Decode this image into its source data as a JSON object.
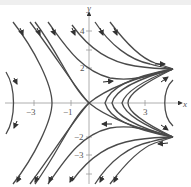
{
  "figure": {
    "type": "phase-portrait",
    "axes": {
      "x_label": "x",
      "y_label": "y",
      "x_ticks": [
        {
          "value": -3,
          "label": "−3"
        },
        {
          "value": -1,
          "label": "−1"
        },
        {
          "value": 3,
          "label": "3"
        }
      ],
      "y_ticks": [
        {
          "value": 4,
          "label": "4"
        },
        {
          "value": 2,
          "label": "2"
        },
        {
          "value": -2,
          "label": "−2"
        },
        {
          "value": -3,
          "label": "−3"
        }
      ]
    },
    "equilibria": [
      {
        "x": 0,
        "y": 0,
        "kind": "saddle"
      },
      {
        "x": 4,
        "y": 2,
        "kind": "sink"
      },
      {
        "x": 4,
        "y": -2,
        "kind": "sink"
      }
    ],
    "colors": {
      "curve": "#4a4a4a",
      "axis": "#9a9a9a",
      "background": "#ffffff"
    }
  }
}
